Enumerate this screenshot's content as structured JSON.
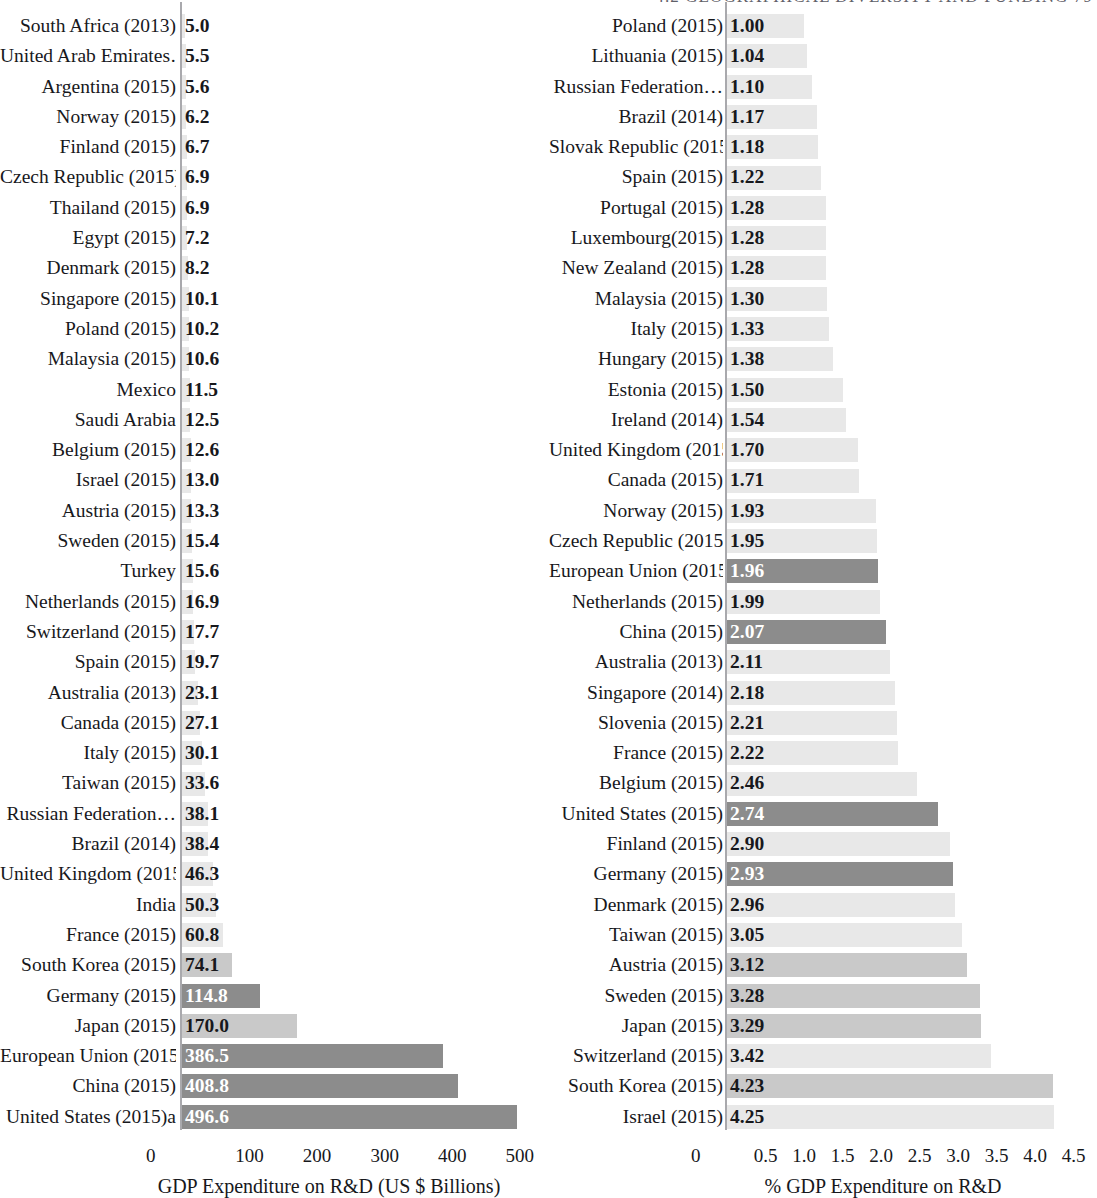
{
  "running_head": "4.2  GEOGRAPHICAL DIVERSITY AND FUNDING    79",
  "colors": {
    "bar_light": "#e8e8e8",
    "bar_mid": "#c9c9c9",
    "bar_dark": "#8c8c8c",
    "text": "#17181c",
    "text_on_dark": "#ffffff",
    "axis": "#a9a9ad"
  },
  "chart_data": [
    {
      "type": "bar",
      "orientation": "horizontal",
      "id": "gdp-expenditure-absolute",
      "title": "",
      "xlabel": "GDP Expenditure on R&D (US $ Billions)",
      "ylabel": "",
      "xlim": [
        0,
        530
      ],
      "xticks": [
        "0",
        "100",
        "200",
        "300",
        "400",
        "500"
      ],
      "xtick_values": [
        0,
        100,
        200,
        300,
        400,
        500
      ],
      "grid": false,
      "legend": "none",
      "categories": [
        "South Africa (2013)",
        "United Arab Emirates…",
        "Argentina (2015)",
        "Norway (2015)",
        "Finland (2015)",
        "Czech Republic (2015)",
        "Thailand (2015)",
        "Egypt (2015)",
        "Denmark (2015)",
        "Singapore (2015)",
        "Poland (2015)",
        "Malaysia (2015)",
        "Mexico",
        "Saudi Arabia",
        "Belgium (2015)",
        "Israel (2015)",
        "Austria (2015)",
        "Sweden (2015)",
        "Turkey",
        "Netherlands (2015)",
        "Switzerland (2015)",
        "Spain (2015)",
        "Australia (2013)",
        "Canada (2015)",
        "Italy (2015)",
        "Taiwan (2015)",
        "Russian Federation…",
        "Brazil (2014)",
        "United Kingdom (2015)",
        "India",
        "France (2015)",
        "South Korea (2015)",
        "Germany (2015)",
        "Japan (2015)",
        "European Union (2015)",
        "China (2015)",
        "United States (2015)a"
      ],
      "values": [
        5.0,
        5.5,
        5.6,
        6.2,
        6.7,
        6.9,
        6.9,
        7.2,
        8.2,
        10.1,
        10.2,
        10.6,
        11.5,
        12.5,
        12.6,
        13.0,
        13.3,
        15.4,
        15.6,
        16.9,
        17.7,
        19.7,
        23.1,
        27.1,
        30.1,
        33.6,
        38.1,
        38.4,
        46.3,
        50.3,
        60.8,
        74.1,
        114.8,
        170.0,
        386.5,
        408.8,
        496.6
      ],
      "labels": [
        "5.0",
        "5.5",
        "5.6",
        "6.2",
        "6.7",
        "6.9",
        "6.9",
        "7.2",
        "8.2",
        "10.1",
        "10.2",
        "10.6",
        "11.5",
        "12.5",
        "12.6",
        "13.0",
        "13.3",
        "15.4",
        "15.6",
        "16.9",
        "17.7",
        "19.7",
        "23.1",
        "27.1",
        "30.1",
        "33.6",
        "38.1",
        "38.4",
        "46.3",
        "50.3",
        "60.8",
        "74.1",
        "114.8",
        "170.0",
        "386.5",
        "408.8",
        "496.6"
      ],
      "shades": [
        "light",
        "light",
        "light",
        "light",
        "light",
        "light",
        "light",
        "light",
        "light",
        "light",
        "light",
        "light",
        "light",
        "light",
        "light",
        "light",
        "light",
        "light",
        "light",
        "light",
        "light",
        "light",
        "light",
        "light",
        "light",
        "light",
        "light",
        "light",
        "light",
        "light",
        "light",
        "mid",
        "dark",
        "mid",
        "dark",
        "dark",
        "dark"
      ]
    },
    {
      "type": "bar",
      "orientation": "horizontal",
      "id": "gdp-expenditure-percent",
      "title": "",
      "xlabel": "% GDP Expenditure on R&D",
      "ylabel": "",
      "xlim": [
        0,
        4.75
      ],
      "xticks": [
        "0",
        "0.5",
        "1.0",
        "1.5",
        "2.0",
        "2.5",
        "3.0",
        "3.5",
        "4.0",
        "4.5"
      ],
      "xtick_values": [
        0,
        0.5,
        1.0,
        1.5,
        2.0,
        2.5,
        3.0,
        3.5,
        4.0,
        4.5
      ],
      "grid": false,
      "legend": "none",
      "categories": [
        "Poland (2015)",
        "Lithuania (2015)",
        "Russian Federation…",
        "Brazil (2014)",
        "Slovak Republic (2015)",
        "Spain (2015)",
        "Portugal (2015)",
        "Luxembourg(2015)",
        "New Zealand (2015)",
        "Malaysia (2015)",
        "Italy (2015)",
        "Hungary (2015)",
        "Estonia (2015)",
        "Ireland (2014)",
        "United Kingdom (2015)",
        "Canada (2015)",
        "Norway (2015)",
        "Czech Republic (2015)",
        "European Union (2015)",
        "Netherlands (2015)",
        "China (2015)",
        "Australia (2013)",
        "Singapore (2014)",
        "Slovenia (2015)",
        "France (2015)",
        "Belgium (2015)",
        "United States (2015)",
        "Finland (2015)",
        "Germany (2015)",
        "Denmark (2015)",
        "Taiwan (2015)",
        "Austria (2015)",
        "Sweden (2015)",
        "Japan (2015)",
        "Switzerland (2015)",
        "South Korea (2015)",
        "Israel (2015)"
      ],
      "values": [
        1.0,
        1.04,
        1.1,
        1.17,
        1.18,
        1.22,
        1.28,
        1.28,
        1.28,
        1.3,
        1.33,
        1.38,
        1.5,
        1.54,
        1.7,
        1.71,
        1.93,
        1.95,
        1.96,
        1.99,
        2.07,
        2.11,
        2.18,
        2.21,
        2.22,
        2.46,
        2.74,
        2.9,
        2.93,
        2.96,
        3.05,
        3.12,
        3.28,
        3.29,
        3.42,
        4.23,
        4.25
      ],
      "labels": [
        "1.00",
        "1.04",
        "1.10",
        "1.17",
        "1.18",
        "1.22",
        "1.28",
        "1.28",
        "1.28",
        "1.30",
        "1.33",
        "1.38",
        "1.50",
        "1.54",
        "1.70",
        "1.71",
        "1.93",
        "1.95",
        "1.96",
        "1.99",
        "2.07",
        "2.11",
        "2.18",
        "2.21",
        "2.22",
        "2.46",
        "2.74",
        "2.90",
        "2.93",
        "2.96",
        "3.05",
        "3.12",
        "3.28",
        "3.29",
        "3.42",
        "4.23",
        "4.25"
      ],
      "shades": [
        "light",
        "light",
        "light",
        "light",
        "light",
        "light",
        "light",
        "light",
        "light",
        "light",
        "light",
        "light",
        "light",
        "light",
        "light",
        "light",
        "light",
        "light",
        "dark",
        "light",
        "dark",
        "light",
        "light",
        "light",
        "light",
        "light",
        "dark",
        "light",
        "dark",
        "light",
        "light",
        "mid",
        "mid",
        "mid",
        "light",
        "mid",
        "light"
      ]
    }
  ]
}
